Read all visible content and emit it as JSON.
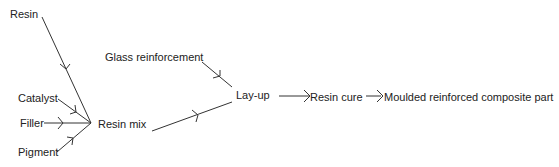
{
  "diagram": {
    "title": "",
    "nodes": {
      "resin": "Resin",
      "catalyst": "Catalyst",
      "filler": "Filler",
      "pigment": "Pigment",
      "resin_mix": "Resin mix",
      "glass_reinforcement": "Glass reinforcement",
      "lay_up": "Lay-up",
      "resin_cure": "Resin cure",
      "moulded_part": "Moulded reinforced composite part"
    },
    "edges": [
      {
        "from": "Resin",
        "to": "Resin mix"
      },
      {
        "from": "Catalyst",
        "to": "Resin mix"
      },
      {
        "from": "Filler",
        "to": "Resin mix"
      },
      {
        "from": "Pigment",
        "to": "Resin mix"
      },
      {
        "from": "Resin mix",
        "to": "Lay-up"
      },
      {
        "from": "Glass reinforcement",
        "to": "Lay-up"
      },
      {
        "from": "Lay-up",
        "to": "Resin cure"
      },
      {
        "from": "Resin cure",
        "to": "Moulded reinforced composite part"
      }
    ],
    "colors": {
      "line": "#333333",
      "text": "#222222",
      "background": "#ffffff"
    }
  }
}
